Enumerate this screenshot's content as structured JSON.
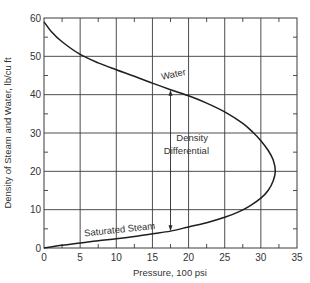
{
  "chart_data": {
    "type": "line",
    "title": "",
    "xlabel": "Pressure, 100 psi",
    "ylabel": "Density of Steam and Water, lb/cu ft",
    "xlim": [
      0,
      35
    ],
    "ylim": [
      0,
      60
    ],
    "x_ticks": [
      0,
      5,
      10,
      15,
      20,
      25,
      30,
      35
    ],
    "y_ticks": [
      0,
      10,
      20,
      30,
      40,
      50,
      60
    ],
    "x_tick_labels": [
      "0",
      "5",
      "10",
      "15",
      "20",
      "25",
      "30",
      "35"
    ],
    "y_tick_labels": [
      "0",
      "10",
      "20",
      "30",
      "40",
      "50",
      "60"
    ],
    "grid": true,
    "legend": null,
    "series": [
      {
        "name": "Water",
        "x": [
          0,
          1,
          2.5,
          5,
          7.5,
          10,
          12.5,
          15,
          17.5,
          20,
          22.5,
          25,
          27.5,
          29,
          30,
          31,
          31.7,
          32
        ],
        "y": [
          59,
          56.5,
          53.8,
          50.5,
          48.3,
          46.5,
          44.8,
          43,
          41.3,
          39.7,
          37.8,
          35.5,
          32.5,
          30,
          28,
          25.5,
          23,
          20
        ]
      },
      {
        "name": "Saturated Steam",
        "x": [
          0,
          2.5,
          5,
          7.5,
          10,
          12.5,
          15,
          17.5,
          20,
          22.5,
          25,
          27,
          28.5,
          30,
          31,
          31.7,
          32
        ],
        "y": [
          0,
          0.7,
          1.3,
          1.9,
          2.4,
          3.0,
          3.7,
          4.4,
          5.5,
          6.6,
          8,
          9.5,
          11,
          13,
          15,
          17.5,
          20
        ]
      }
    ],
    "annotations": [
      {
        "text": "Water",
        "x": 18,
        "y": 44.5,
        "rotation": -12
      },
      {
        "text": "Saturated Steam",
        "x": 10.5,
        "y": 4,
        "rotation": -6
      },
      {
        "text": "Density",
        "x": 20.5,
        "y": 28,
        "rotation": 0
      },
      {
        "text": "Differential",
        "x": 19.7,
        "y": 24.5,
        "rotation": 0
      },
      {
        "text": "double-arrow",
        "x": 17.5,
        "y_from": 4.4,
        "y_to": 41.3,
        "rotation": 0
      }
    ],
    "minor_ticks": {
      "x": [
        2.5,
        7.5,
        12.5,
        17.5,
        22.5,
        27.5,
        32.5
      ],
      "y": [
        5,
        15,
        25,
        35,
        45,
        55
      ]
    }
  }
}
